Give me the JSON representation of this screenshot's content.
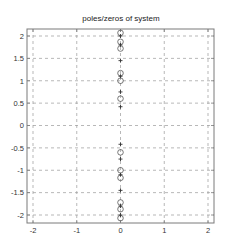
{
  "chart_data": {
    "type": "scatter",
    "title": "poles/zeros of system",
    "xlabel": "",
    "ylabel": "",
    "xlim": [
      -2.15,
      2.15
    ],
    "ylim": [
      -2.18,
      2.18
    ],
    "grid": true,
    "grid_style": "dashed",
    "xticks": [
      -2,
      -1,
      0,
      1,
      2
    ],
    "xtick_labels": [
      "-2",
      "-1",
      "0",
      "1",
      "2"
    ],
    "yticks": [
      2,
      1.5,
      1,
      0.5,
      0,
      -0.5,
      -1,
      -1.5,
      -2
    ],
    "ytick_labels": [
      "2",
      "1.5",
      "1",
      "0.5",
      "0",
      "-0.5",
      "-1",
      "-1.5",
      "-2"
    ],
    "legend": null,
    "series": [
      {
        "name": "zeros",
        "marker": "o",
        "points": [
          {
            "x": 0,
            "y": 2.07
          },
          {
            "x": 0,
            "y": 1.87
          },
          {
            "x": 0,
            "y": 1.72
          },
          {
            "x": 0,
            "y": 1.17
          },
          {
            "x": 0,
            "y": 1.0
          },
          {
            "x": 0,
            "y": 0.6
          },
          {
            "x": 0,
            "y": -0.6
          },
          {
            "x": 0,
            "y": -1.0
          },
          {
            "x": 0,
            "y": -1.17
          },
          {
            "x": 0,
            "y": -1.72
          },
          {
            "x": 0,
            "y": -1.87
          },
          {
            "x": 0,
            "y": -2.07
          }
        ]
      },
      {
        "name": "poles",
        "marker": "+",
        "points": [
          {
            "x": 0,
            "y": 2.0
          },
          {
            "x": 0,
            "y": 1.8
          },
          {
            "x": 0,
            "y": 1.45
          },
          {
            "x": 0,
            "y": 1.1
          },
          {
            "x": 0,
            "y": 0.75
          },
          {
            "x": 0,
            "y": 0.42
          },
          {
            "x": 0,
            "y": -0.42
          },
          {
            "x": 0,
            "y": -0.75
          },
          {
            "x": 0,
            "y": -1.1
          },
          {
            "x": 0,
            "y": -1.45
          },
          {
            "x": 0,
            "y": -1.8
          },
          {
            "x": 0,
            "y": -2.0
          }
        ]
      }
    ]
  },
  "colors": {
    "frame": "#7a7a7a",
    "grid": "#9a9a9a",
    "marker": "#555555",
    "text": "#222222"
  }
}
